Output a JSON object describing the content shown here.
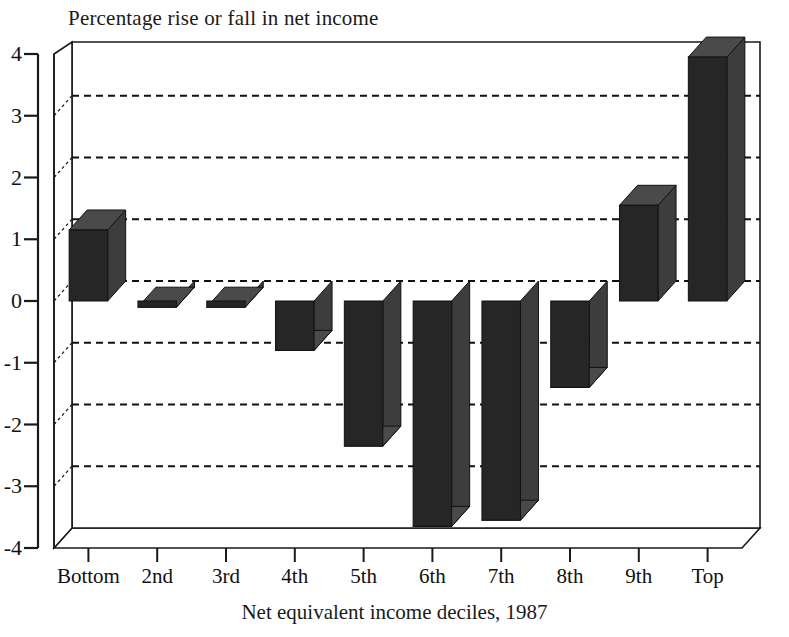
{
  "chart_data": {
    "type": "bar",
    "title": "Percentage rise or fall in net income",
    "xlabel": "Net equivalent income deciles, 1987",
    "ylabel": "",
    "categories": [
      "Bottom",
      "2nd",
      "3rd",
      "4th",
      "5th",
      "6th",
      "7th",
      "8th",
      "9th",
      "Top"
    ],
    "values": [
      1.15,
      -0.1,
      -0.1,
      -0.8,
      -2.35,
      -3.65,
      -3.55,
      -1.4,
      1.55,
      3.95
    ],
    "ylim": [
      -4,
      4
    ],
    "yticks": [
      4,
      3,
      2,
      1,
      0,
      -1,
      -2,
      -3,
      -4
    ],
    "ytick_labels": [
      "4",
      "3",
      "2",
      "1",
      "0",
      "-1",
      "-2",
      "-3",
      "-4"
    ],
    "gridlines": [
      3,
      2,
      1,
      0,
      -1,
      -2,
      -3
    ],
    "grid": true,
    "grid_style": "dashed",
    "legend": null,
    "style": "3d-bar",
    "bar_color": "#262626",
    "bar_side_color": "#3d3d3d",
    "bar_top_color": "#4a4a4a",
    "axis_color": "#1a1a1a",
    "background": "#ffffff"
  }
}
